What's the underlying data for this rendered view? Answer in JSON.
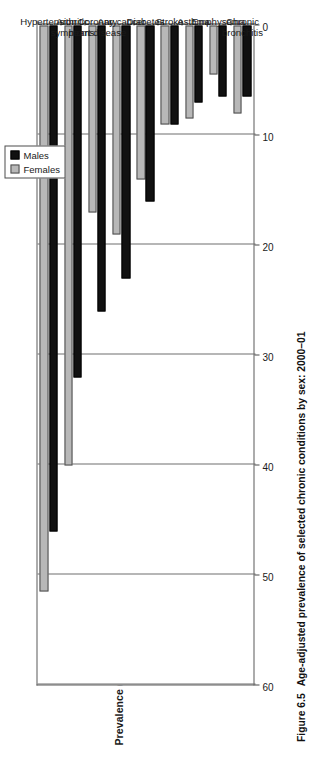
{
  "figure": {
    "number": "Figure 6.5",
    "caption": "Age-adjusted prevalence of selected chronic conditions by sex: 2000–01"
  },
  "legend": {
    "position": "top-left (rotated)",
    "entries": [
      {
        "label": "Males",
        "color": "#111111",
        "icon": "square-swatch-black"
      },
      {
        "label": "Females",
        "color": "#b8b8b8",
        "icon": "square-swatch-gray"
      }
    ]
  },
  "axis": {
    "value_title": "Prevalence (%)",
    "ticks": [
      "60",
      "50",
      "40",
      "30",
      "20",
      "10",
      "0"
    ]
  },
  "categories_display": [
    "Hypertension",
    "Arthritic\nsymptoms",
    "Coronary\nheart disease",
    "Any cancer",
    "Diabetes",
    "Stroke",
    "Asthma",
    "Emphysema",
    "Chronic\nbronchitis"
  ],
  "chart_data": {
    "type": "bar",
    "orientation": "horizontal",
    "title": "Age-adjusted prevalence of selected chronic conditions by sex: 2000–01",
    "xlabel": "Prevalence (%)",
    "ylabel": "",
    "xlim": [
      0,
      60
    ],
    "xticks": [
      0,
      10,
      20,
      30,
      40,
      50,
      60
    ],
    "grid": true,
    "legend_position": "top",
    "categories": [
      "Hypertension",
      "Arthritic symptoms",
      "Coronary heart disease",
      "Any cancer",
      "Diabetes",
      "Stroke",
      "Asthma",
      "Emphysema",
      "Chronic bronchitis"
    ],
    "series": [
      {
        "name": "Males",
        "color": "#111111",
        "values": [
          46,
          32,
          26,
          23,
          16,
          9,
          7,
          6.5,
          6.5
        ]
      },
      {
        "name": "Females",
        "color": "#b8b8b8",
        "values": [
          51.5,
          40,
          17,
          19,
          14,
          9,
          8.5,
          4.5,
          8
        ]
      }
    ]
  }
}
